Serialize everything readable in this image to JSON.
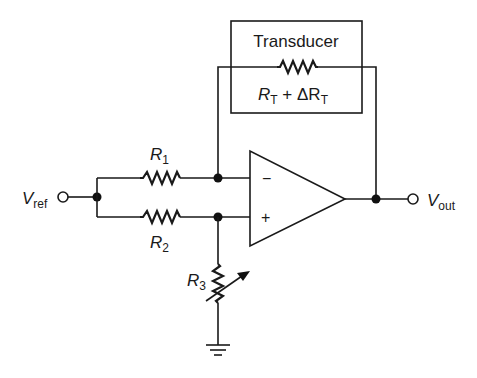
{
  "diagram": {
    "type": "circuit-schematic",
    "transducer_box": {
      "title": "Transducer",
      "resistance_label_main": "R",
      "resistance_label_sub": "T",
      "resistance_label_plus": " + ΔR",
      "resistance_label_sub2": "T"
    },
    "resistors": [
      {
        "id": "R1",
        "label": "R",
        "sub": "1"
      },
      {
        "id": "R2",
        "label": "R",
        "sub": "2"
      },
      {
        "id": "R3",
        "label": "R",
        "sub": "3",
        "variable": true
      }
    ],
    "terminals": {
      "input": {
        "label": "V",
        "sub": "ref"
      },
      "output": {
        "label": "V",
        "sub": "out"
      }
    },
    "opamp": {
      "minus": "−",
      "plus": "+"
    },
    "colors": {
      "line": "#1a1a1a",
      "background": "#ffffff"
    }
  }
}
